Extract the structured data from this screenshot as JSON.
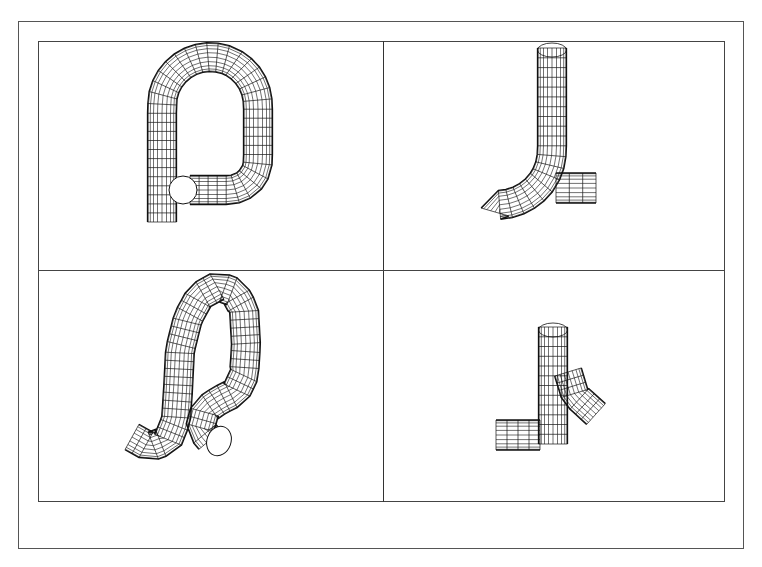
{
  "drawing": {
    "title": "",
    "views": [
      {
        "id": "view-top-left",
        "label": "",
        "shape": "loop-pipe-front"
      },
      {
        "id": "view-top-right",
        "label": "",
        "shape": "loop-pipe-side"
      },
      {
        "id": "view-bottom-left",
        "label": "",
        "shape": "loop-pipe-isometric"
      },
      {
        "id": "view-bottom-right",
        "label": "",
        "shape": "loop-pipe-side-rotated"
      }
    ]
  },
  "colors": {
    "background": "#ffffff",
    "frame": "#555555",
    "wire": "#111111"
  },
  "layout": {
    "outer_frame": [
      18,
      21,
      744,
      549
    ],
    "inner_frame": [
      38,
      41,
      724,
      501
    ],
    "vertical_divider_x": 383,
    "horizontal_divider_y": 270
  }
}
